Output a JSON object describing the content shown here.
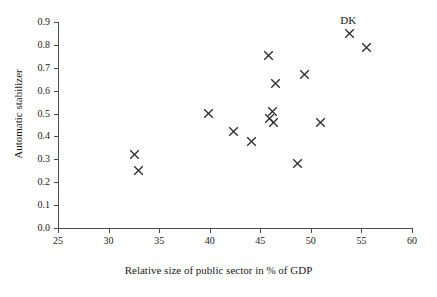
{
  "chart_data": {
    "type": "scatter",
    "title": "",
    "xlabel": "Relative size of public sector in % of GDP",
    "ylabel": "Automatic stabilizer",
    "xlim": [
      25,
      60
    ],
    "ylim": [
      0.0,
      0.9
    ],
    "xticks": [
      25,
      30,
      35,
      40,
      45,
      50,
      55,
      60
    ],
    "yticks": [
      0.0,
      0.1,
      0.2,
      0.3,
      0.4,
      0.5,
      0.6,
      0.7,
      0.8,
      0.9
    ],
    "xtick_labels": [
      "25",
      "30",
      "35",
      "40",
      "45",
      "50",
      "55",
      "60"
    ],
    "ytick_labels": [
      "0.0",
      "0.1",
      "0.2",
      "0.3",
      "0.4",
      "0.5",
      "0.6",
      "0.7",
      "0.8",
      "0.9"
    ],
    "grid": false,
    "legend": false,
    "marker": "x",
    "marker_color": "#2b2b2b",
    "points": [
      {
        "x": 32.6,
        "y": 0.32
      },
      {
        "x": 33.0,
        "y": 0.25
      },
      {
        "x": 39.9,
        "y": 0.5
      },
      {
        "x": 42.4,
        "y": 0.42
      },
      {
        "x": 44.1,
        "y": 0.38
      },
      {
        "x": 45.8,
        "y": 0.755
      },
      {
        "x": 45.9,
        "y": 0.48
      },
      {
        "x": 46.2,
        "y": 0.51
      },
      {
        "x": 46.3,
        "y": 0.46
      },
      {
        "x": 46.5,
        "y": 0.63
      },
      {
        "x": 48.7,
        "y": 0.28
      },
      {
        "x": 49.4,
        "y": 0.67
      },
      {
        "x": 51.0,
        "y": 0.46
      },
      {
        "x": 53.8,
        "y": 0.85,
        "label": "DK"
      },
      {
        "x": 55.5,
        "y": 0.79
      }
    ],
    "annotations": [
      {
        "text": "DK",
        "x": 53.9,
        "y": 0.905
      }
    ]
  }
}
